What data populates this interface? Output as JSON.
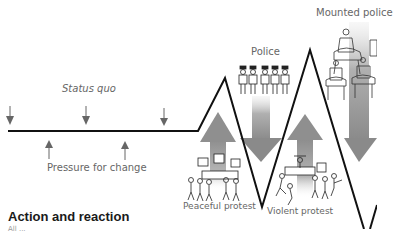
{
  "diagram": {
    "title": "Action and reaction",
    "subtitle": "All ...",
    "labels": {
      "status_quo": "Status quo",
      "pressure_for_change": "Pressure for change",
      "police": "Police",
      "mounted_police": "Mounted police",
      "peaceful_protest": "Peaceful protest",
      "violent_protest": "Violent protest"
    },
    "colors": {
      "line": "#111111",
      "arrow_small": "#666666",
      "arrow_big_top": "#d8d8d8",
      "arrow_big_bottom": "#8a8a8a",
      "text": "#666666",
      "title": "#1a1a1a"
    },
    "stages": [
      {
        "name": "Status quo",
        "direction": "flat"
      },
      {
        "name": "Peaceful protest",
        "direction": "up"
      },
      {
        "name": "Police",
        "direction": "down"
      },
      {
        "name": "Violent protest",
        "direction": "up"
      },
      {
        "name": "Mounted police",
        "direction": "down"
      }
    ]
  }
}
